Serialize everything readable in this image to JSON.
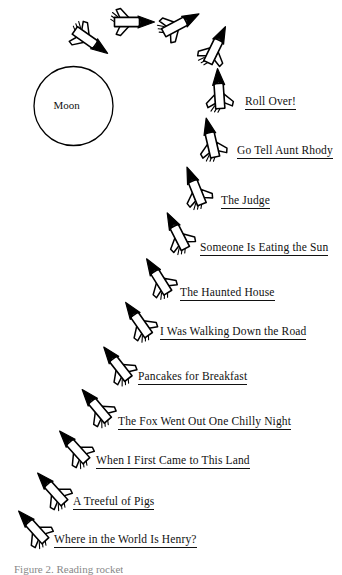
{
  "figure": {
    "background_color": "#ffffff",
    "ink_color": "#000000",
    "moon": {
      "label": "Moon",
      "cx": 73.5,
      "cy": 106,
      "r": 39.5
    },
    "caption": "Figure 2. Reading rocket"
  },
  "labels": [
    {
      "text": "Roll Over!",
      "x": 245,
      "y": 95
    },
    {
      "text": "Go Tell Aunt Rhody",
      "x": 237,
      "y": 144
    },
    {
      "text": "The Judge",
      "x": 221,
      "y": 194
    },
    {
      "text": "Someone Is Eating the Sun",
      "x": 200,
      "y": 241
    },
    {
      "text": "The Haunted House",
      "x": 180,
      "y": 286
    },
    {
      "text": "I Was Walking Down the Road",
      "x": 160,
      "y": 325
    },
    {
      "text": "Pancakes for Breakfast",
      "x": 138,
      "y": 370
    },
    {
      "text": "The Fox Went Out One Chilly Night",
      "x": 118,
      "y": 415
    },
    {
      "text": "When I First Came to This Land",
      "x": 96,
      "y": 454
    },
    {
      "text": "A Treeful of Pigs",
      "x": 73,
      "y": 495
    },
    {
      "text": "Where in the World Is Henry?",
      "x": 54,
      "y": 533
    }
  ],
  "rockets": [
    {
      "name": "rocket-01",
      "x": 33,
      "y": 527,
      "angle": -42,
      "scale": 1.0
    },
    {
      "name": "rocket-02",
      "x": 52,
      "y": 489,
      "angle": -42,
      "scale": 1.0
    },
    {
      "name": "rocket-03",
      "x": 74,
      "y": 447,
      "angle": -42,
      "scale": 1.0
    },
    {
      "name": "rocket-04",
      "x": 96,
      "y": 406,
      "angle": -40,
      "scale": 1.0
    },
    {
      "name": "rocket-05",
      "x": 117,
      "y": 364,
      "angle": -38,
      "scale": 1.0
    },
    {
      "name": "rocket-06",
      "x": 138,
      "y": 320,
      "angle": -35,
      "scale": 1.0
    },
    {
      "name": "rocket-07",
      "x": 158,
      "y": 277,
      "angle": -32,
      "scale": 1.0
    },
    {
      "name": "rocket-08",
      "x": 177,
      "y": 232,
      "angle": -27,
      "scale": 1.0
    },
    {
      "name": "rocket-09",
      "x": 195,
      "y": 187,
      "angle": -22,
      "scale": 1.0
    },
    {
      "name": "rocket-10",
      "x": 211,
      "y": 139,
      "angle": -13,
      "scale": 1.0
    },
    {
      "name": "rocket-11",
      "x": 219,
      "y": 90,
      "angle": -4,
      "scale": 1.0
    },
    {
      "name": "rocket-12",
      "x": 216,
      "y": 46,
      "angle": 26,
      "scale": 1.0
    },
    {
      "name": "rocket-13",
      "x": 180,
      "y": 24,
      "angle": 62,
      "scale": 1.0
    },
    {
      "name": "rocket-14",
      "x": 133,
      "y": 22,
      "angle": 90,
      "scale": 1.0
    },
    {
      "name": "rocket-15",
      "x": 90,
      "y": 41,
      "angle": 125,
      "scale": 1.0
    }
  ]
}
